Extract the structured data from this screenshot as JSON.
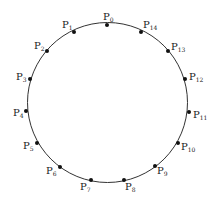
{
  "diagram": {
    "type": "circle-with-points",
    "circle": {
      "cx": 108,
      "cy": 103,
      "r": 82,
      "stroke": "#333333"
    },
    "points": [
      {
        "label": "P",
        "sub": "0",
        "x": 107,
        "y": 25,
        "lx": 103,
        "ly": 20
      },
      {
        "label": "P",
        "sub": "1",
        "x": 74,
        "y": 32,
        "lx": 62,
        "ly": 28
      },
      {
        "label": "P",
        "sub": "2",
        "x": 47,
        "y": 51,
        "lx": 34,
        "ly": 49
      },
      {
        "label": "P",
        "sub": "3",
        "x": 30,
        "y": 79,
        "lx": 16,
        "ly": 80
      },
      {
        "label": "P",
        "sub": "4",
        "x": 26,
        "y": 111,
        "lx": 13,
        "ly": 116
      },
      {
        "label": "P",
        "sub": "5",
        "x": 37,
        "y": 143,
        "lx": 23,
        "ly": 149
      },
      {
        "label": "P",
        "sub": "6",
        "x": 60,
        "y": 167,
        "lx": 46,
        "ly": 174
      },
      {
        "label": "P",
        "sub": "7",
        "x": 91,
        "y": 180,
        "lx": 80,
        "ly": 190
      },
      {
        "label": "P",
        "sub": "8",
        "x": 124,
        "y": 180,
        "lx": 125,
        "ly": 190
      },
      {
        "label": "P",
        "sub": "9",
        "x": 155,
        "y": 166,
        "lx": 157,
        "ly": 174
      },
      {
        "label": "P",
        "sub": "10",
        "x": 178,
        "y": 143,
        "lx": 181,
        "ly": 150
      },
      {
        "label": "P",
        "sub": "11",
        "x": 189,
        "y": 112,
        "lx": 193,
        "ly": 118
      },
      {
        "label": "P",
        "sub": "12",
        "x": 185,
        "y": 79,
        "lx": 189,
        "ly": 80
      },
      {
        "label": "P",
        "sub": "13",
        "x": 168,
        "y": 51,
        "lx": 171,
        "ly": 50
      },
      {
        "label": "P",
        "sub": "14",
        "x": 141,
        "y": 32,
        "lx": 143,
        "ly": 28
      }
    ]
  }
}
